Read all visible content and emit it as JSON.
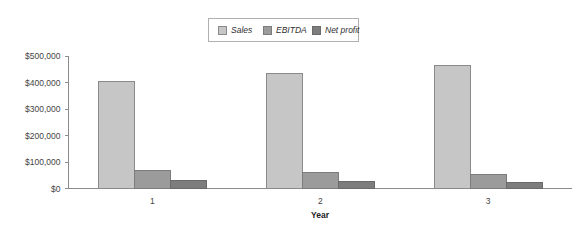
{
  "chart_data": {
    "type": "bar",
    "title": "",
    "subtitle": "",
    "xlabel": "Year",
    "ylabel": "",
    "categories": [
      "1",
      "2",
      "3"
    ],
    "series": [
      {
        "name": "Sales",
        "values": [
          405000,
          435000,
          465000
        ],
        "color": "#c6c6c6",
        "border": "#8a8a8a"
      },
      {
        "name": "EBITDA",
        "values": [
          68000,
          60000,
          52000
        ],
        "color": "#9b9b9b",
        "border": "#7c7c7c"
      },
      {
        "name": "Net profit",
        "values": [
          30000,
          26000,
          21000
        ],
        "color": "#7d7d7d",
        "border": "#6a6a6a"
      }
    ],
    "ylim": [
      0,
      500000
    ],
    "ytick_values": [
      0,
      100000,
      200000,
      300000,
      400000,
      500000
    ],
    "ytick_labels": [
      "$0",
      "$100,000",
      "$200,000",
      "$300,000",
      "$400,000",
      "$500,000"
    ],
    "xtick_labels": [
      "1",
      "2",
      "3"
    ],
    "grid": false,
    "legend_position": "top-center",
    "legend_entries": [
      "Sales",
      "EBITDA",
      "Net profit"
    ],
    "axis_color": "#8c8c8c",
    "background": "#ffffff"
  },
  "legend": {
    "items": [
      {
        "label": "Sales",
        "swatch_name": "legend-swatch-sales"
      },
      {
        "label": "EBITDA",
        "swatch_name": "legend-swatch-ebitda"
      },
      {
        "label": "Net profit",
        "swatch_name": "legend-swatch-net-profit"
      }
    ]
  },
  "axes": {
    "x_title": "Year",
    "y_labels": [
      "$500,000",
      "$400,000",
      "$300,000",
      "$200,000",
      "$100,000",
      "$0"
    ],
    "x_labels": [
      "1",
      "2",
      "3"
    ]
  }
}
